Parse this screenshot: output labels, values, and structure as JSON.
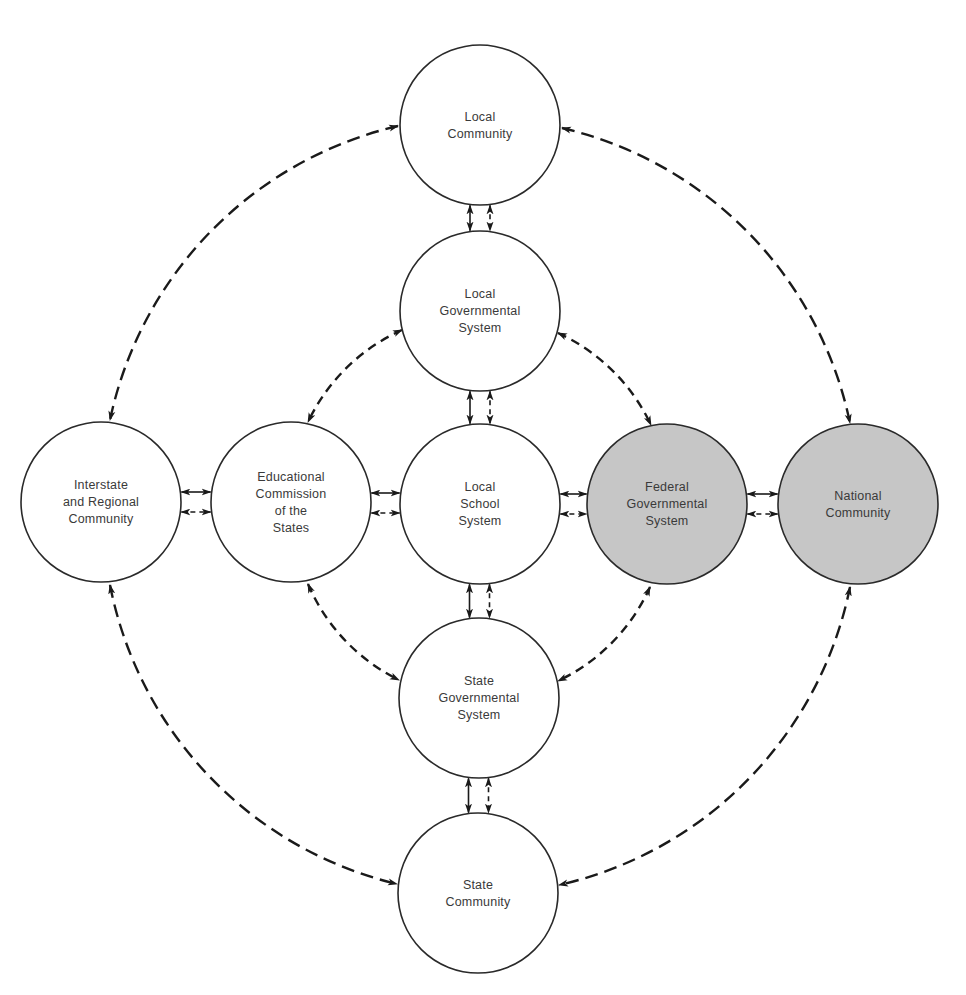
{
  "diagram": {
    "type": "relationship-network",
    "colors": {
      "background": "#ffffff",
      "node_fill_default": "#ffffff",
      "node_fill_highlight": "#c6c6c6",
      "stroke": "#2a2a2a",
      "text": "#3a3a3a"
    },
    "nodes": [
      {
        "id": "local-community",
        "lines": [
          "Local",
          "Community"
        ],
        "cx": 480,
        "cy": 125,
        "r": 80,
        "highlight": false
      },
      {
        "id": "local-governmental-system",
        "lines": [
          "Local",
          "Governmental",
          "System"
        ],
        "cx": 480,
        "cy": 311,
        "r": 80,
        "highlight": false
      },
      {
        "id": "local-school-system",
        "lines": [
          "Local",
          "School",
          "System"
        ],
        "cx": 480,
        "cy": 504,
        "r": 80,
        "highlight": false
      },
      {
        "id": "state-governmental-system",
        "lines": [
          "State",
          "Governmental",
          "System"
        ],
        "cx": 479,
        "cy": 698,
        "r": 80,
        "highlight": false
      },
      {
        "id": "state-community",
        "lines": [
          "State",
          "Community"
        ],
        "cx": 478,
        "cy": 893,
        "r": 80,
        "highlight": false
      },
      {
        "id": "interstate-regional-community",
        "lines": [
          "Interstate",
          "and Regional",
          "Community"
        ],
        "cx": 101,
        "cy": 502,
        "r": 80,
        "highlight": false
      },
      {
        "id": "educational-commission",
        "lines": [
          "Educational",
          "Commission",
          "of the",
          "States"
        ],
        "cx": 291,
        "cy": 502,
        "r": 80,
        "highlight": false
      },
      {
        "id": "federal-governmental-system",
        "lines": [
          "Federal",
          "Governmental",
          "System"
        ],
        "cx": 667,
        "cy": 504,
        "r": 80,
        "highlight": true
      },
      {
        "id": "national-community",
        "lines": [
          "National",
          "Community"
        ],
        "cx": 858,
        "cy": 504,
        "r": 80,
        "highlight": true
      }
    ],
    "direct_links": [
      {
        "from": "local-community",
        "to": "local-governmental-system",
        "kinds": [
          "solid",
          "dashed"
        ],
        "orientation": "vertical"
      },
      {
        "from": "local-governmental-system",
        "to": "local-school-system",
        "kinds": [
          "solid",
          "dashed"
        ],
        "orientation": "vertical"
      },
      {
        "from": "local-school-system",
        "to": "state-governmental-system",
        "kinds": [
          "solid",
          "dashed"
        ],
        "orientation": "vertical"
      },
      {
        "from": "state-governmental-system",
        "to": "state-community",
        "kinds": [
          "solid",
          "dashed"
        ],
        "orientation": "vertical"
      },
      {
        "from": "interstate-regional-community",
        "to": "educational-commission",
        "kinds": [
          "solid",
          "dashed"
        ],
        "orientation": "horizontal"
      },
      {
        "from": "educational-commission",
        "to": "local-school-system",
        "kinds": [
          "solid",
          "dashed"
        ],
        "orientation": "horizontal"
      },
      {
        "from": "local-school-system",
        "to": "federal-governmental-system",
        "kinds": [
          "solid",
          "dashed"
        ],
        "orientation": "horizontal"
      },
      {
        "from": "federal-governmental-system",
        "to": "national-community",
        "kinds": [
          "solid",
          "dashed"
        ],
        "orientation": "horizontal"
      }
    ],
    "arc_links": [
      {
        "from": "local-community",
        "to": "interstate-regional-community",
        "ring": "outer",
        "style": "dashed-bidirectional"
      },
      {
        "from": "local-community",
        "to": "national-community",
        "ring": "outer",
        "style": "dashed-bidirectional"
      },
      {
        "from": "interstate-regional-community",
        "to": "state-community",
        "ring": "outer",
        "style": "dashed-bidirectional"
      },
      {
        "from": "national-community",
        "to": "state-community",
        "ring": "outer",
        "style": "dashed-bidirectional"
      },
      {
        "from": "local-governmental-system",
        "to": "educational-commission",
        "ring": "inner",
        "style": "dashed-bidirectional"
      },
      {
        "from": "local-governmental-system",
        "to": "federal-governmental-system",
        "ring": "inner",
        "style": "dashed-bidirectional"
      },
      {
        "from": "educational-commission",
        "to": "state-governmental-system",
        "ring": "inner",
        "style": "dashed-bidirectional"
      },
      {
        "from": "federal-governmental-system",
        "to": "state-governmental-system",
        "ring": "inner",
        "style": "dashed-bidirectional"
      }
    ]
  }
}
